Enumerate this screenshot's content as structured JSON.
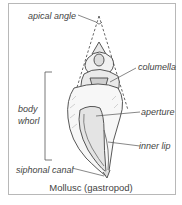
{
  "diagram": {
    "caption": "Mollusc (gastropod)",
    "labels": {
      "apical_angle": "apical angle",
      "columella": "columella",
      "body_whorl_line1": "body",
      "body_whorl_line2": "whorl",
      "aperture": "aperture",
      "inner_lip": "inner lip",
      "siphonal_canal": "siphonal canal"
    },
    "colors": {
      "ink": "#444444",
      "frame": "#b8b8b8",
      "shading": "#9a9a9a"
    }
  }
}
